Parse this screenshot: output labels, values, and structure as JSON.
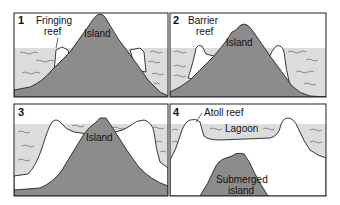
{
  "diagram": {
    "panels": [
      {
        "number": "1",
        "labels": {
          "reef": "Fringing\nreef",
          "reef_line1": "Fringing",
          "reef_line2": "reef",
          "island": "Island"
        }
      },
      {
        "number": "2",
        "labels": {
          "reef_line1": "Barrier",
          "reef_line2": "reef",
          "island": "Island"
        }
      },
      {
        "number": "3",
        "labels": {
          "island": "Island"
        }
      },
      {
        "number": "4",
        "labels": {
          "reef": "Atoll reef",
          "lagoon": "Lagoon",
          "island_line1": "Submerged",
          "island_line2": "island"
        }
      }
    ],
    "colors": {
      "water": "#dcdcdc",
      "island": "#8c8c8c",
      "reef": "#ffffff",
      "outline": "#222222"
    }
  }
}
